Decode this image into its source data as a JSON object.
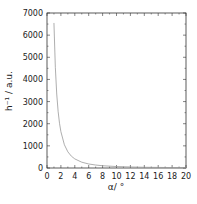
{
  "chart_data": {
    "type": "line",
    "title": "",
    "xlabel": "α/ °",
    "ylabel": "h⁻¹ / a.u.",
    "xlim": [
      0,
      20
    ],
    "ylim": [
      0,
      7000
    ],
    "xticks": [
      "0",
      "2",
      "4",
      "6",
      "8",
      "10",
      "12",
      "14",
      "16",
      "18",
      "20"
    ],
    "yticks": [
      "0",
      "1000",
      "2000",
      "3000",
      "4000",
      "5000",
      "6000",
      "7000"
    ],
    "grid": false,
    "legend": null,
    "series": [
      {
        "name": "h⁻¹",
        "color": "#999999",
        "x": [
          1.0,
          1.2,
          1.4,
          1.6,
          1.8,
          2.0,
          2.5,
          3.0,
          3.5,
          4.0,
          5.0,
          6.0,
          7.0,
          8.0,
          10.0,
          12.0,
          14.0,
          16.0,
          18.0,
          20.0
        ],
        "y": [
          6550,
          4550,
          3340,
          2560,
          2020,
          1640,
          1050,
          730,
          535,
          410,
          262,
          182,
          134,
          102,
          66,
          46,
          33,
          26,
          20,
          16
        ]
      }
    ]
  }
}
